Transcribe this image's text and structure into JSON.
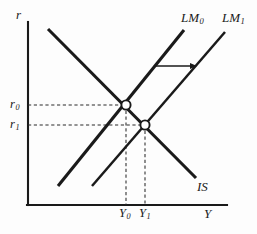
{
  "figure": {
    "background_color": "#fdfdfd",
    "line_color": "#1a1a1a",
    "point_fill_color": "#ffffff"
  },
  "axes": {
    "y_label": "r",
    "x_label": "Y",
    "y_axis_x": 28,
    "x_axis_y": 205,
    "y_axis_top": 22,
    "x_axis_right": 227
  },
  "curves": [
    {
      "id": "IS",
      "label": "IS",
      "label_sub": "",
      "x1": 48,
      "y1": 29,
      "x2": 196,
      "y2": 178,
      "label_x": 197,
      "label_y": 180
    },
    {
      "id": "LM0",
      "label": "LM",
      "label_sub": "0",
      "x1": 58,
      "y1": 186,
      "x2": 184,
      "y2": 30,
      "label_x": 181,
      "label_y": 11
    },
    {
      "id": "LM1",
      "label": "LM",
      "label_sub": "1",
      "x1": 92,
      "y1": 186,
      "x2": 225,
      "y2": 32,
      "label_x": 222,
      "label_y": 11
    }
  ],
  "equilibria": [
    {
      "id": "E0",
      "x": 126,
      "y": 105,
      "radius": 4.6
    },
    {
      "id": "E1",
      "x": 145,
      "y": 125,
      "radius": 4.6
    }
  ],
  "tick_labels": {
    "r0": {
      "text": "r",
      "sub": "0",
      "x": 10,
      "y": 98
    },
    "r1": {
      "text": "r",
      "sub": "1",
      "x": 10,
      "y": 118
    },
    "y0": {
      "text": "Y",
      "sub": "0",
      "x": 119,
      "y": 207
    },
    "y1": {
      "text": "Y",
      "sub": "1",
      "x": 139,
      "y": 207
    },
    "r_axis": {
      "text": "r",
      "x": 16,
      "y": 8
    },
    "y_axis": {
      "text": "Y",
      "x": 204,
      "y": 207
    }
  },
  "guide_lines": [
    {
      "id": "h0",
      "x1": 28,
      "y1": 105,
      "x2": 126,
      "y2": 105
    },
    {
      "id": "h1",
      "x1": 28,
      "y1": 125,
      "x2": 145,
      "y2": 125
    },
    {
      "id": "v0",
      "x1": 126,
      "y1": 105,
      "x2": 126,
      "y2": 205
    },
    {
      "id": "v1",
      "x1": 145,
      "y1": 125,
      "x2": 145,
      "y2": 205
    }
  ],
  "shift_arrow": {
    "id": "lm-shift-arrow",
    "x1": 155,
    "y1": 66,
    "x2": 197,
    "y2": 66
  }
}
